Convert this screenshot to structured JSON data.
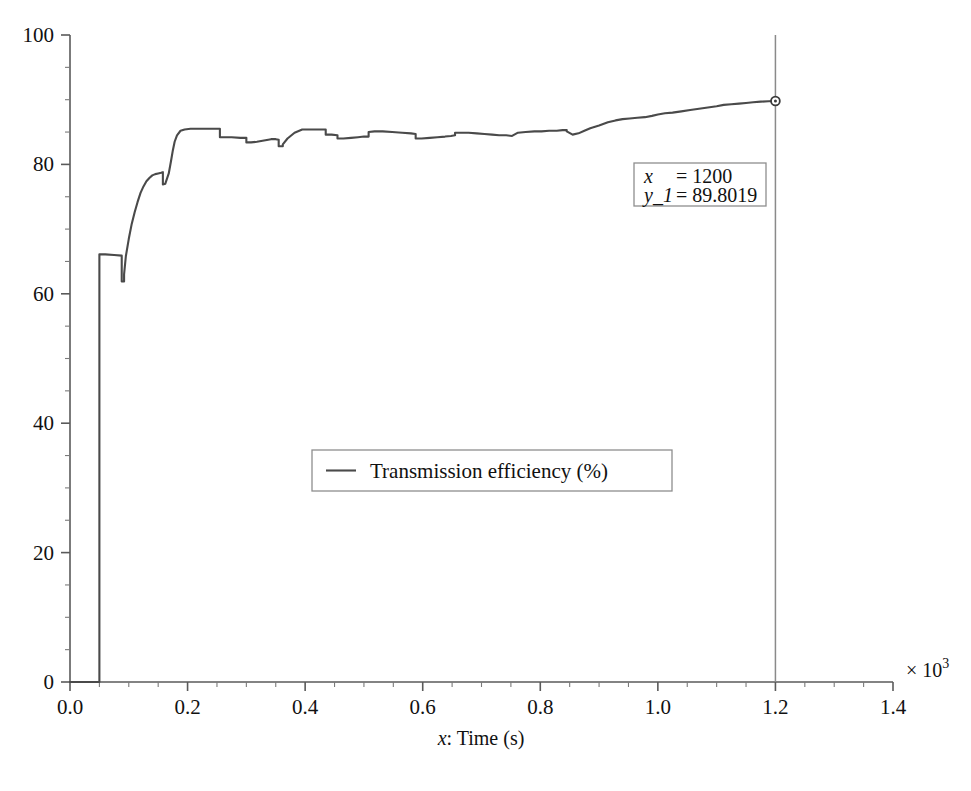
{
  "chart_data": {
    "type": "line",
    "title": "",
    "subtitle": "",
    "xlabel": "x: Time (s)",
    "xlabel_italic_prefix": "x",
    "xlabel_rest": ": Time (s)",
    "ylabel": "",
    "x_multiplier": "× 10",
    "x_multiplier_exponent": "3",
    "x_multiplier_value": 1000,
    "xlim": [
      0.0,
      1.4
    ],
    "ylim": [
      0,
      100
    ],
    "x_ticks": [
      "0.0",
      "0.2",
      "0.4",
      "0.6",
      "0.8",
      "1.0",
      "1.2",
      "1.4"
    ],
    "x_tick_values": [
      0.0,
      0.2,
      0.4,
      0.6,
      0.8,
      1.0,
      1.2,
      1.4
    ],
    "x_minor_tick_step": 0.05,
    "y_ticks": [
      "0",
      "20",
      "40",
      "60",
      "80",
      "100"
    ],
    "y_tick_values": [
      0,
      20,
      40,
      60,
      80,
      100
    ],
    "y_minor_tick_step": 5,
    "grid": false,
    "legend_position": "center",
    "line_color": "#4a4a4a",
    "axis_color": "#555555",
    "cursor_color": "#8a8a8a",
    "series": [
      {
        "name": "Transmission efficiency (%)",
        "color": "#4a4a4a",
        "x": [
          0.0,
          0.02,
          0.04,
          0.05,
          0.05,
          0.06,
          0.075,
          0.088,
          0.088,
          0.092,
          0.092,
          0.095,
          0.1,
          0.105,
          0.11,
          0.115,
          0.12,
          0.125,
          0.13,
          0.135,
          0.14,
          0.145,
          0.15,
          0.155,
          0.158,
          0.158,
          0.162,
          0.168,
          0.172,
          0.175,
          0.178,
          0.182,
          0.188,
          0.195,
          0.205,
          0.215,
          0.228,
          0.24,
          0.25,
          0.255,
          0.255,
          0.262,
          0.275,
          0.29,
          0.3,
          0.3,
          0.308,
          0.318,
          0.33,
          0.342,
          0.35,
          0.355,
          0.355,
          0.362,
          0.362,
          0.37,
          0.382,
          0.395,
          0.41,
          0.425,
          0.435,
          0.435,
          0.445,
          0.455,
          0.455,
          0.465,
          0.478,
          0.49,
          0.5,
          0.508,
          0.508,
          0.518,
          0.532,
          0.548,
          0.565,
          0.58,
          0.588,
          0.588,
          0.598,
          0.612,
          0.625,
          0.638,
          0.648,
          0.655,
          0.655,
          0.665,
          0.678,
          0.692,
          0.705,
          0.718,
          0.73,
          0.742,
          0.752,
          0.752,
          0.762,
          0.775,
          0.79,
          0.802,
          0.815,
          0.828,
          0.838,
          0.845,
          0.845,
          0.855,
          0.865,
          0.875,
          0.885,
          0.9,
          0.915,
          0.928,
          0.94,
          0.952,
          0.965,
          0.978,
          0.99,
          1.0,
          1.012,
          1.025,
          1.04,
          1.055,
          1.07,
          1.085,
          1.1,
          1.112,
          1.125,
          1.138,
          1.15,
          1.162,
          1.175,
          1.188,
          1.2
        ],
        "y": [
          0.0,
          0.0,
          0.0,
          0.0,
          66.1,
          66.1,
          66.0,
          65.9,
          61.9,
          61.9,
          63.0,
          65.8,
          68.5,
          70.8,
          72.6,
          74.2,
          75.6,
          76.6,
          77.4,
          77.9,
          78.3,
          78.5,
          78.6,
          78.7,
          78.8,
          76.9,
          77.0,
          78.6,
          80.6,
          82.2,
          83.5,
          84.5,
          85.2,
          85.4,
          85.5,
          85.5,
          85.5,
          85.5,
          85.5,
          85.5,
          84.2,
          84.2,
          84.2,
          84.1,
          84.1,
          83.4,
          83.4,
          83.5,
          83.7,
          83.9,
          83.9,
          83.8,
          82.8,
          82.8,
          83.1,
          84.0,
          84.9,
          85.4,
          85.4,
          85.4,
          85.4,
          84.6,
          84.6,
          84.5,
          84.0,
          84.0,
          84.1,
          84.2,
          84.3,
          84.3,
          85.0,
          85.1,
          85.1,
          85.0,
          84.9,
          84.8,
          84.7,
          84.0,
          84.0,
          84.1,
          84.2,
          84.3,
          84.4,
          84.5,
          84.9,
          84.9,
          84.9,
          84.8,
          84.7,
          84.6,
          84.5,
          84.5,
          84.4,
          84.4,
          84.9,
          85.0,
          85.1,
          85.1,
          85.2,
          85.2,
          85.3,
          85.3,
          85.1,
          84.6,
          84.8,
          85.2,
          85.6,
          86.0,
          86.5,
          86.8,
          87.0,
          87.1,
          87.2,
          87.3,
          87.5,
          87.7,
          87.9,
          88.0,
          88.2,
          88.4,
          88.6,
          88.8,
          89.0,
          89.2,
          89.3,
          89.4,
          89.5,
          89.6,
          89.7,
          89.75,
          89.8019
        ]
      }
    ],
    "legend": [
      {
        "label": "Transmission efficiency (%)",
        "color": "#4a4a4a",
        "marker": "line"
      }
    ],
    "data_cursor": {
      "x_label": "x",
      "x_equals": "= 1200",
      "y_label": "y_1",
      "y_equals": "= 89.8019",
      "x_value": 1200,
      "y_value": 89.8019,
      "marker": "circle"
    }
  }
}
